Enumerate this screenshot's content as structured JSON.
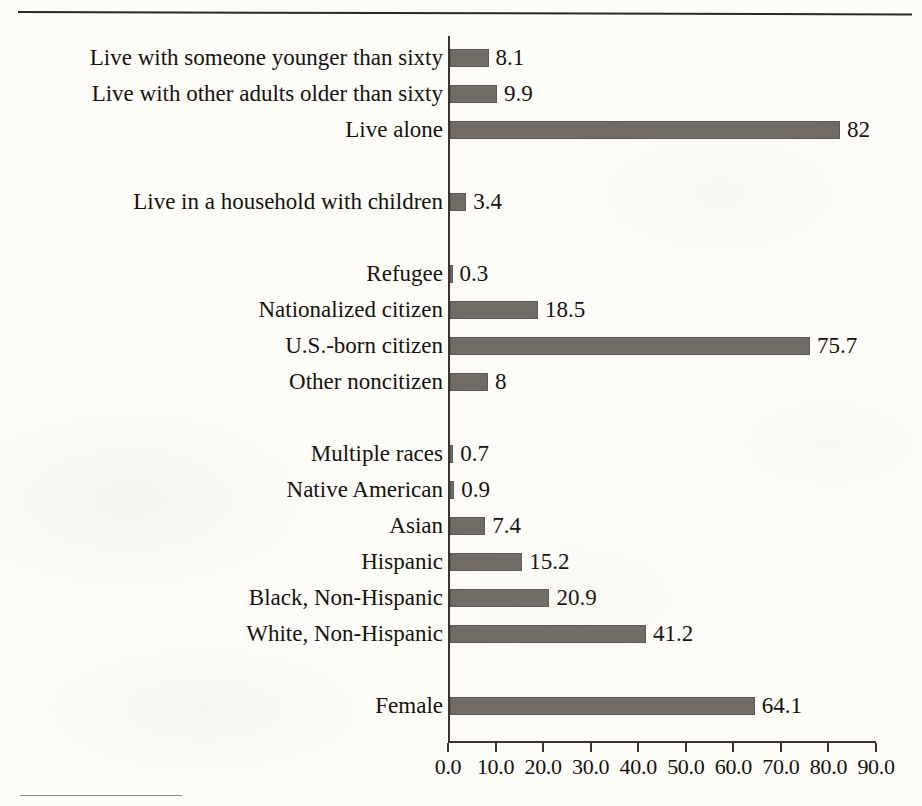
{
  "page": {
    "background_color": "#fdfcf8",
    "ink_color": "#15120f",
    "bar_color": "#6f6c66"
  },
  "chart_data": {
    "type": "bar",
    "orientation": "horizontal",
    "title": "",
    "subtitle": "",
    "xlabel": "",
    "ylabel": "",
    "xlim": [
      0,
      90
    ],
    "grid": false,
    "legend": null,
    "x_tick_labels": [
      "0.0",
      "10.0",
      "20.0",
      "30.0",
      "40.0",
      "50.0",
      "60.0",
      "70.0",
      "80.0",
      "90.0"
    ],
    "x_tick_values": [
      0,
      10,
      20,
      30,
      40,
      50,
      60,
      70,
      80,
      90
    ],
    "categories": [
      "Live with someone younger than sixty",
      "Live with other adults older than sixty",
      "Live alone",
      "Live in a household with children",
      "Refugee",
      "Nationalized citizen",
      "U.S.-born citizen",
      "Other noncitizen",
      "Multiple races",
      "Native American",
      "Asian",
      "Hispanic",
      "Black, Non-Hispanic",
      "White, Non-Hispanic",
      "Female"
    ],
    "values": [
      8.1,
      9.9,
      82,
      3.4,
      0.3,
      18.5,
      75.7,
      8,
      0.7,
      0.9,
      7.4,
      15.2,
      20.9,
      41.2,
      64.1
    ],
    "value_labels": [
      "8.1",
      "9.9",
      "82",
      "3.4",
      "0.3",
      "18.5",
      "75.7",
      "8",
      "0.7",
      "0.9",
      "7.4",
      "15.2",
      "20.9",
      "41.2",
      "64.1"
    ],
    "bars": [
      {
        "label": "Live with someone younger than sixty",
        "value": 8.1,
        "value_label": "8.1",
        "row": 0
      },
      {
        "label": "Live with other adults older than sixty",
        "value": 9.9,
        "value_label": "9.9",
        "row": 1
      },
      {
        "label": "Live alone",
        "value": 82,
        "value_label": "82",
        "row": 2
      },
      {
        "label": "Live in a household with children",
        "value": 3.4,
        "value_label": "3.4",
        "row": 4
      },
      {
        "label": "Refugee",
        "value": 0.3,
        "value_label": "0.3",
        "row": 6
      },
      {
        "label": "Nationalized citizen",
        "value": 18.5,
        "value_label": "18.5",
        "row": 7
      },
      {
        "label": "U.S.-born citizen",
        "value": 75.7,
        "value_label": "75.7",
        "row": 8
      },
      {
        "label": "Other noncitizen",
        "value": 8,
        "value_label": "8",
        "row": 9
      },
      {
        "label": "Multiple races",
        "value": 0.7,
        "value_label": "0.7",
        "row": 11
      },
      {
        "label": "Native American",
        "value": 0.9,
        "value_label": "0.9",
        "row": 12
      },
      {
        "label": "Asian",
        "value": 7.4,
        "value_label": "7.4",
        "row": 13
      },
      {
        "label": "Hispanic",
        "value": 15.2,
        "value_label": "15.2",
        "row": 14
      },
      {
        "label": "Black, Non-Hispanic",
        "value": 20.9,
        "value_label": "20.9",
        "row": 15
      },
      {
        "label": "White, Non-Hispanic",
        "value": 41.2,
        "value_label": "41.2",
        "row": 16
      },
      {
        "label": "Female",
        "value": 64.1,
        "value_label": "64.1",
        "row": 18
      }
    ]
  },
  "geometry": {
    "axis_x_px": 448,
    "axis_top_px": 36,
    "axis_baseline_px": 741,
    "px_per_unit": 4.756,
    "row0_center_px": 58,
    "row_pitch_px": 36,
    "bar_height_px": 18
  }
}
